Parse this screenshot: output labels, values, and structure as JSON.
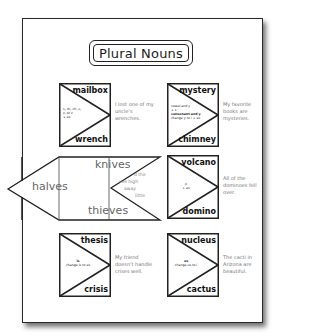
{
  "title": "Plural Nouns",
  "cards": [
    {
      "singular": "mailbox",
      "plural": "wrench",
      "rule_lines": [
        "s, sh, ch, x,",
        "z, or z",
        "+ es"
      ],
      "sentence": "I lost one of my uncle's wrenches."
    },
    {
      "singular": "mystery",
      "plural": "chimney",
      "rule_lines": [
        "vowel and y",
        "+ s",
        "consonant and y",
        "change y to i + es"
      ],
      "sentence": "My favorite books are mysteries."
    },
    {
      "singular": "volcano",
      "plural": "domino",
      "rule_lines": [
        "o",
        "+ es"
      ],
      "sentence": "All of the dominoes fell over."
    },
    {
      "singular": "thesis",
      "plural": "crisis",
      "rule_lines": [
        "is",
        "change is to es"
      ],
      "sentence": "My friend doesn't handle crises well."
    },
    {
      "singular": "nucleus",
      "plural": "cactus",
      "rule_lines": [
        "us",
        "change us to i"
      ],
      "sentence": "The cacti in Arizona are beautiful."
    }
  ],
  "unfolded_card": {
    "left_flap_word": "halves",
    "top_word": "knives",
    "bottom_word": "thieves",
    "partial_sentence_lines": [
      "d the",
      "ves high",
      "away",
      "little"
    ]
  },
  "colors": {
    "line": "#222222",
    "sentence_text": "#777777",
    "page_bg": "#ffffff"
  }
}
